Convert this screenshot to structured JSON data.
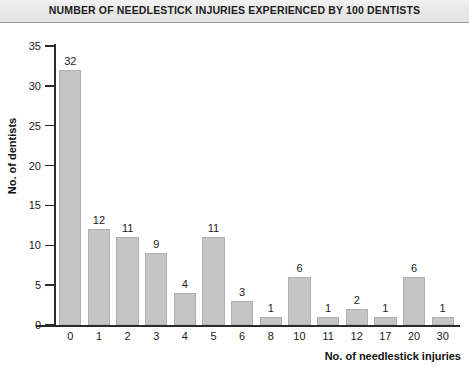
{
  "chart_data": {
    "type": "bar",
    "title": "NUMBER OF NEEDLESTICK INJURIES EXPERIENCED BY 100 DENTISTS",
    "xlabel": "No. of needlestick injuries",
    "ylabel": "No. of dentists",
    "categories": [
      "0",
      "1",
      "2",
      "3",
      "4",
      "5",
      "6",
      "8",
      "10",
      "11",
      "12",
      "17",
      "20",
      "30"
    ],
    "values": [
      32,
      12,
      11,
      9,
      4,
      11,
      3,
      1,
      6,
      1,
      2,
      1,
      6,
      1
    ],
    "data_labels": [
      "32",
      "12",
      "11",
      "9",
      "4",
      "11",
      "3",
      "1",
      "6",
      "1",
      "2",
      "1",
      "6",
      "1"
    ],
    "ylim": [
      0,
      35
    ],
    "ytick_labels": [
      "0",
      "5",
      "10",
      "15",
      "20",
      "25",
      "30",
      "35"
    ],
    "ytick_values": [
      0,
      5,
      10,
      15,
      20,
      25,
      30,
      35
    ],
    "grid": false,
    "legend": false,
    "bar_color": "#c4c4c4",
    "bar_border_color": "#b0b0b0",
    "axis_color": "#2b2b2b",
    "background": "#ffffff",
    "title_band_color": "#e9e9e9"
  }
}
